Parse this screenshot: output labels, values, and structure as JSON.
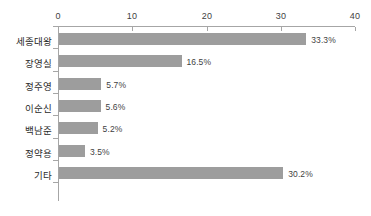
{
  "chart_data": {
    "type": "bar",
    "orientation": "horizontal",
    "title": "",
    "xlabel": "",
    "ylabel": "",
    "categories": [
      "세종대왕",
      "장영실",
      "정주영",
      "이순신",
      "백남준",
      "정약용",
      "기타"
    ],
    "values": [
      33.3,
      16.5,
      5.7,
      5.6,
      5.2,
      3.5,
      30.2
    ],
    "data_labels": [
      "33.3%",
      "16.5%",
      "5.7%",
      "5.6%",
      "5.2%",
      "3.5%",
      "30.2%"
    ],
    "xlim": [
      0,
      40
    ],
    "xticks": [
      0,
      10,
      20,
      30,
      40
    ],
    "xtick_labels": [
      "0",
      "10",
      "20",
      "30",
      "40"
    ],
    "grid": false,
    "legend": null,
    "axis_position": "top",
    "colors": {
      "bar": "#9d9d9d",
      "axis": "#a6a6a6",
      "text": "#2b2b2b",
      "label_text": "#3f3f3f",
      "background": "#ffffff"
    }
  }
}
